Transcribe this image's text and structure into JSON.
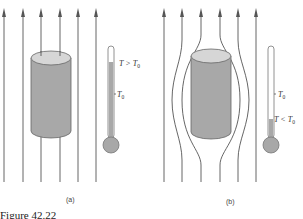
{
  "figure": {
    "caption": "Figure 42.22",
    "panels": [
      {
        "id": "a",
        "label": "(a)",
        "description": "Field lines pass straight through cylinder",
        "thermometer": {
          "reading_label": "T > T",
          "reading_sub": "0",
          "reference_label": "T",
          "reference_sub": "0",
          "fill_level": 0.88
        }
      },
      {
        "id": "b",
        "label": "(b)",
        "description": "Field lines expelled around cylinder",
        "thermometer": {
          "reading_label": "T < T",
          "reading_sub": "0",
          "reference_label": "T",
          "reference_sub": "0",
          "fill_level": 0.22
        }
      }
    ],
    "colors": {
      "line": "#555555",
      "cylinder_body": "#a8a8a8",
      "cylinder_top": "#d6d6d6",
      "mercury": "#a8a8a8"
    }
  }
}
